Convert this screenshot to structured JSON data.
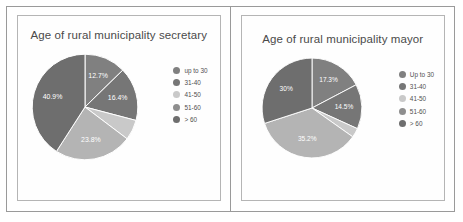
{
  "figure": {
    "panels": [
      {
        "id": "secretary",
        "title": "Age of rural municipality secretary",
        "legend": [
          {
            "label": "up to 30",
            "color": "#808080"
          },
          {
            "label": "31-40",
            "color": "#767676"
          },
          {
            "label": "41-50",
            "color": "#c9c9c9"
          },
          {
            "label": "51-60",
            "color": "#8e8e8e"
          },
          {
            "label": "> 60",
            "color": "#6e6e6e"
          }
        ]
      },
      {
        "id": "mayor",
        "title": "Age of rural municipality mayor",
        "legend": [
          {
            "label": "Up to 30",
            "color": "#808080"
          },
          {
            "label": "31-40",
            "color": "#767676"
          },
          {
            "label": "41-50",
            "color": "#c9c9c9"
          },
          {
            "label": "51-60",
            "color": "#8e8e8e"
          },
          {
            "label": "> 60",
            "color": "#6e6e6e"
          }
        ]
      }
    ]
  },
  "chart_data": [
    {
      "type": "pie",
      "title": "Age of rural municipality secretary",
      "xlabel": "",
      "ylabel": "",
      "legend_position": "right",
      "categories": [
        "up to 30",
        "31-40",
        "41-50",
        "51-60",
        "> 60"
      ],
      "values": [
        12.7,
        16.4,
        6.2,
        23.8,
        40.9
      ],
      "labels": [
        "12.7%",
        "16.4%",
        "",
        "23.8%",
        "40.9%"
      ],
      "colors": [
        "#808080",
        "#767676",
        "#c9c9c9",
        "#b4b4b4",
        "#6e6e6e"
      ],
      "label_visible": [
        true,
        true,
        false,
        true,
        true
      ]
    },
    {
      "type": "pie",
      "title": "Age of rural municipality mayor",
      "xlabel": "",
      "ylabel": "",
      "legend_position": "right",
      "categories": [
        "Up to 30",
        "31-40",
        "41-50",
        "51-60",
        "> 60"
      ],
      "values": [
        17.3,
        14.5,
        3.0,
        35.2,
        30.0
      ],
      "labels": [
        "17.3%",
        "14.5%",
        "",
        "35.2%",
        "30%"
      ],
      "colors": [
        "#808080",
        "#767676",
        "#c9c9c9",
        "#b4b4b4",
        "#6e6e6e"
      ],
      "label_visible": [
        true,
        true,
        false,
        true,
        true
      ]
    }
  ]
}
